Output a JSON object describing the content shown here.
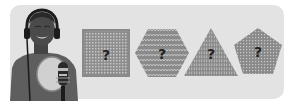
{
  "illustration": {
    "background_color": "#e3e3e3",
    "figure": {
      "description": "person wearing headphones singing into a studio microphone with pop filter",
      "icon": "singer-with-microphone-icon"
    },
    "shapes": [
      {
        "type": "square",
        "pattern": "grid",
        "label": "?",
        "icon": "square-grid-icon"
      },
      {
        "type": "hexagon",
        "pattern": "zigzag",
        "label": "?",
        "icon": "hexagon-zigzag-icon"
      },
      {
        "type": "triangle",
        "pattern": "vertical-stripes",
        "label": "?",
        "icon": "triangle-stripes-icon"
      },
      {
        "type": "pentagon",
        "pattern": "dots",
        "label": "?",
        "icon": "pentagon-dots-icon"
      }
    ],
    "colors": {
      "shape_fill": "#8a8a8a",
      "shape_pattern": "#c4c4c4",
      "question_mark": "#222222"
    }
  }
}
